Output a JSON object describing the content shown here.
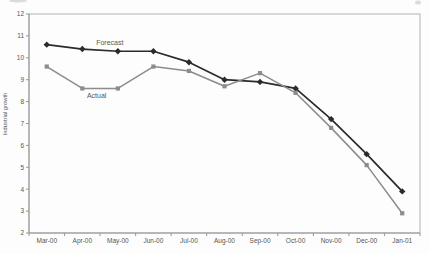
{
  "figure": {
    "kind": "scanned line chart",
    "background": "#fdfdfd"
  },
  "chart_data": {
    "type": "line",
    "title": "",
    "xlabel": "",
    "ylabel": "Industrial growth",
    "ylim": [
      2,
      12
    ],
    "ytick_step": 1,
    "grid": false,
    "legend_position": "inline-labels",
    "axis_color": "#b2b2b2",
    "axis_dark_color": "#979797",
    "text_color": "#555555",
    "categories": [
      "Mar-00",
      "Apr-00",
      "May-00",
      "Jun-00",
      "Jul-00",
      "Aug-00",
      "Sep-00",
      "Oct-00",
      "Nov-00",
      "Dec-00",
      "Jan-01"
    ],
    "series": [
      {
        "name": "Forecast",
        "color": "#2b2b2b",
        "marker": "diamond",
        "line_width": 1.7,
        "values": [
          10.6,
          10.4,
          10.3,
          10.3,
          9.8,
          9.0,
          8.9,
          8.6,
          7.2,
          5.6,
          3.9
        ],
        "label_pos": {
          "month_index": 1.39,
          "value": 10.58
        }
      },
      {
        "name": "Actual",
        "color": "#8c8c8c",
        "marker": "square",
        "line_width": 1.5,
        "values": [
          9.6,
          8.6,
          8.6,
          9.6,
          9.4,
          8.7,
          9.3,
          8.4,
          6.8,
          5.1,
          2.9
        ],
        "label_pos": {
          "month_index": 1.13,
          "value": 8.16
        }
      }
    ]
  }
}
